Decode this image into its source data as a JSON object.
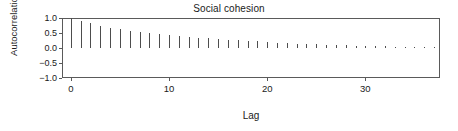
{
  "chart_data": {
    "type": "bar",
    "title": "Social cohesion",
    "xlabel": "Lag",
    "ylabel": "Autocorrelation",
    "xlim": [
      -0.9,
      37.6
    ],
    "ylim": [
      -1.0,
      1.0
    ],
    "grid": false,
    "legend": null,
    "xticks": [
      0,
      10,
      20,
      30
    ],
    "xtick_labels": [
      "0",
      "10",
      "20",
      "30"
    ],
    "yticks": [
      1.0,
      0.5,
      0.0,
      -0.5,
      -1.0
    ],
    "ytick_labels": [
      "1.0",
      "0.5",
      "0.0",
      "-0.5",
      "-1.0"
    ],
    "series_name": "Autocorrelation",
    "bar_color": "#4d4d4d",
    "x": [
      0,
      1,
      2,
      3,
      4,
      5,
      6,
      7,
      8,
      9,
      10,
      11,
      12,
      13,
      14,
      15,
      16,
      17,
      18,
      19,
      20,
      21,
      22,
      23,
      24,
      25,
      26,
      27,
      28,
      29,
      30,
      31,
      32,
      33,
      34,
      35,
      36,
      37
    ],
    "categories": [
      "0",
      "1",
      "2",
      "3",
      "4",
      "5",
      "6",
      "7",
      "8",
      "9",
      "10",
      "11",
      "12",
      "13",
      "14",
      "15",
      "16",
      "17",
      "18",
      "19",
      "20",
      "21",
      "22",
      "23",
      "24",
      "25",
      "26",
      "27",
      "28",
      "29",
      "30",
      "31",
      "32",
      "33",
      "34",
      "35",
      "36",
      "37"
    ],
    "values": [
      1.0,
      0.9,
      0.82,
      0.74,
      0.68,
      0.63,
      0.58,
      0.54,
      0.5,
      0.47,
      0.44,
      0.41,
      0.38,
      0.35,
      0.32,
      0.3,
      0.28,
      0.26,
      0.24,
      0.22,
      0.2,
      0.18,
      0.17,
      0.15,
      0.14,
      0.12,
      0.11,
      0.1,
      0.09,
      0.08,
      0.07,
      0.07,
      0.06,
      0.05,
      0.05,
      0.04,
      0.04,
      0.03
    ]
  },
  "labels": {
    "title": "Social cohesion",
    "xlabel": "Lag",
    "ylabel": "Autocorrelation"
  }
}
